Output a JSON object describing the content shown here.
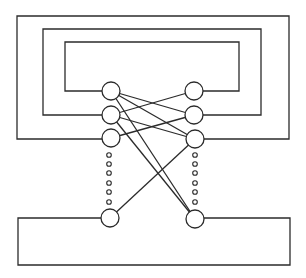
{
  "diagram": {
    "width": 306,
    "height": 278,
    "stroke_color": "#2b2b2b",
    "background": "#ffffff",
    "stroke_width": 1.3,
    "node_radius": 9,
    "dot_radius": 2.3,
    "loops": [
      {
        "id": "loop-outer",
        "left": 17,
        "top": 16,
        "right": 289,
        "bottom": 139,
        "left_node": "L3",
        "right_node": "R3"
      },
      {
        "id": "loop-middle",
        "left": 43,
        "top": 29,
        "right": 261,
        "bottom": 115,
        "left_node": "L2",
        "right_node": "R2"
      },
      {
        "id": "loop-inner",
        "left": 65,
        "top": 42,
        "right": 239,
        "bottom": 91,
        "left_node": "L1",
        "right_node": "R1"
      },
      {
        "id": "loop-bottom",
        "left": 18,
        "top": 218,
        "right": 290,
        "bottom": 265,
        "left_node": "L4",
        "right_node": "R4",
        "open_side": "top"
      }
    ],
    "nodes": [
      {
        "id": "L1",
        "x": 111,
        "y": 91
      },
      {
        "id": "L2",
        "x": 111,
        "y": 115
      },
      {
        "id": "L3",
        "x": 111,
        "y": 138
      },
      {
        "id": "L4",
        "x": 110,
        "y": 218
      },
      {
        "id": "R1",
        "x": 194,
        "y": 91
      },
      {
        "id": "R2",
        "x": 194,
        "y": 115
      },
      {
        "id": "R3",
        "x": 195,
        "y": 139
      },
      {
        "id": "R4",
        "x": 195,
        "y": 219
      }
    ],
    "edges": [
      {
        "from": "L1",
        "to": "R2"
      },
      {
        "from": "L1",
        "to": "R3"
      },
      {
        "from": "L1",
        "to": "R4"
      },
      {
        "from": "L2",
        "to": "R1"
      },
      {
        "from": "L2",
        "to": "R3"
      },
      {
        "from": "L2",
        "to": "R4"
      },
      {
        "from": "L3",
        "to": "R2"
      },
      {
        "from": "L4",
        "to": "R3"
      }
    ],
    "ellipsis_dots": {
      "left_x": 109,
      "right_x": 195,
      "ys": [
        155,
        164,
        173,
        183,
        192,
        202
      ]
    }
  }
}
